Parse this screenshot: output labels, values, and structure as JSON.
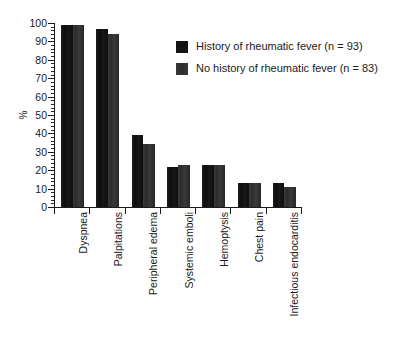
{
  "chart_data": {
    "type": "bar",
    "title": "",
    "subtitle": "",
    "xlabel": "",
    "ylabel": "%",
    "ylim": [
      0,
      100
    ],
    "y_ticks": [
      0,
      10,
      20,
      30,
      40,
      50,
      60,
      70,
      80,
      90,
      100
    ],
    "y_tick_labels": [
      "0",
      "10",
      "20",
      "30",
      "40",
      "50",
      "60",
      "70",
      "80",
      "90",
      "100"
    ],
    "minor_ticks": true,
    "grid": false,
    "legend_position": "upper right",
    "categories": [
      "Dyspnea",
      "Palpitations",
      "Peripheral edema",
      "Systemic emboli",
      "Hemoptysis",
      "Chest pain",
      "Infectious endocarditis"
    ],
    "series": [
      {
        "name": "History of rheumatic fever (n = 93)",
        "color": "#141414",
        "values": [
          99,
          97,
          39,
          22,
          23,
          13,
          13
        ]
      },
      {
        "name": "No history of rheumatic fever (n = 83)",
        "color": "#333333",
        "values": [
          99,
          94,
          34,
          23,
          23,
          13,
          11
        ]
      }
    ]
  },
  "legend": {
    "items": [
      {
        "label": "History of rheumatic fever (n = 93)"
      },
      {
        "label": "No history of rheumatic fever (n = 83)"
      }
    ]
  }
}
